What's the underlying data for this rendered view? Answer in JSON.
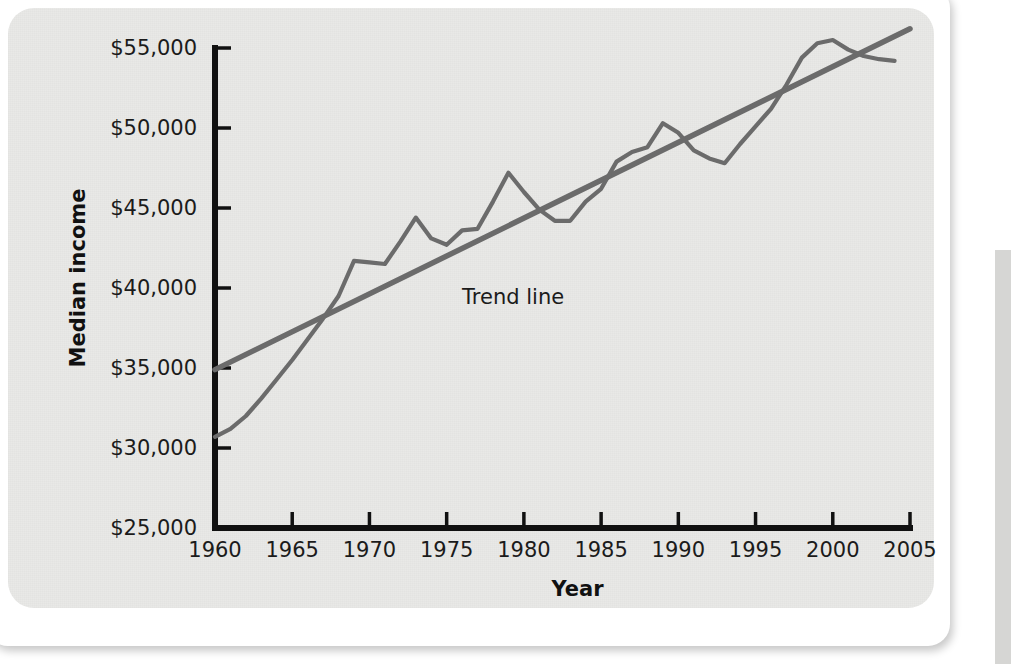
{
  "figure": {
    "background_color": "#e9e9e7",
    "page_color": "#ffffff"
  },
  "chart_data": {
    "type": "line",
    "title": "",
    "xlabel": "Year",
    "ylabel": "Median income",
    "xlim": [
      1960,
      2005
    ],
    "ylim": [
      25000,
      55000
    ],
    "grid": false,
    "legend_position": "inline-annotation",
    "x_ticks": [
      1960,
      1965,
      1970,
      1975,
      1980,
      1985,
      1990,
      1995,
      2000,
      2005
    ],
    "x_tick_labels": [
      "1960",
      "1965",
      "1970",
      "1975",
      "1980",
      "1985",
      "1990",
      "1995",
      "2000",
      "2005"
    ],
    "y_ticks": [
      25000,
      30000,
      35000,
      40000,
      45000,
      50000,
      55000
    ],
    "y_tick_labels": [
      "$25,000",
      "$30,000",
      "$35,000",
      "$40,000",
      "$45,000",
      "$50,000",
      "$55,000"
    ],
    "annotations": [
      {
        "text": "Trend line",
        "x": 1976,
        "y": 39000
      }
    ],
    "series": [
      {
        "name": "Median income",
        "color": "#6b6b6b",
        "x": [
          1960,
          1961,
          1962,
          1963,
          1964,
          1965,
          1966,
          1967,
          1968,
          1969,
          1970,
          1971,
          1972,
          1973,
          1974,
          1975,
          1976,
          1977,
          1978,
          1979,
          1980,
          1981,
          1982,
          1983,
          1984,
          1985,
          1986,
          1987,
          1988,
          1989,
          1990,
          1991,
          1992,
          1993,
          1994,
          1995,
          1996,
          1997,
          1998,
          1999,
          2000,
          2001,
          2002,
          2003,
          2004
        ],
        "y": [
          30700,
          31200,
          32000,
          33100,
          34300,
          35500,
          36800,
          38100,
          39500,
          41700,
          41600,
          41500,
          42900,
          44400,
          43100,
          42700,
          43600,
          43700,
          45400,
          47200,
          46000,
          44900,
          44200,
          44200,
          45400,
          46200,
          47900,
          48500,
          48800,
          50300,
          49700,
          48600,
          48100,
          47800,
          49000,
          50100,
          51200,
          52700,
          54400,
          55300,
          55500,
          54900,
          54500,
          54300,
          54200
        ]
      },
      {
        "name": "Trend line",
        "color": "#6b6b6b",
        "x": [
          1960,
          2005
        ],
        "y": [
          34900,
          56200
        ]
      }
    ]
  },
  "axes": {
    "x_axis_label": "Year",
    "y_axis_label": "Median income",
    "axis_color": "#111111"
  }
}
